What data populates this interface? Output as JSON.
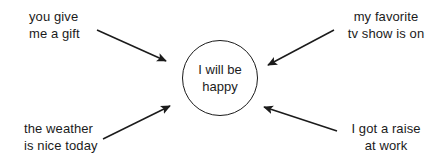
{
  "diagram": {
    "type": "concept-map",
    "background_color": "#ffffff",
    "stroke_color": "#1b1b1b",
    "text_color": "#1b1b1b",
    "center": {
      "shape": "circle",
      "lines": [
        "I will be",
        "happy"
      ]
    },
    "nodes": [
      {
        "id": "top-left",
        "position": "top-left",
        "align": "left",
        "lines": [
          "you give",
          "me a gift"
        ]
      },
      {
        "id": "top-right",
        "position": "top-right",
        "align": "center",
        "lines": [
          "my favorite",
          "tv show is on"
        ]
      },
      {
        "id": "bottom-left",
        "position": "bottom-left",
        "align": "left",
        "lines": [
          "the weather",
          "is nice today"
        ]
      },
      {
        "id": "bottom-right",
        "position": "bottom-right",
        "align": "center",
        "lines": [
          "I got a raise",
          "at work"
        ]
      }
    ],
    "arrows": [
      {
        "id": "arrow-top-left-to-center",
        "from": "top-left",
        "to": "center"
      },
      {
        "id": "arrow-top-right-to-center",
        "from": "top-right",
        "to": "center"
      },
      {
        "id": "arrow-bottom-left-to-center",
        "from": "bottom-left",
        "to": "center"
      },
      {
        "id": "arrow-bottom-right-to-center",
        "from": "bottom-right",
        "to": "center"
      }
    ]
  }
}
